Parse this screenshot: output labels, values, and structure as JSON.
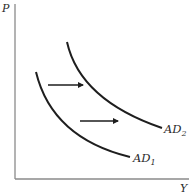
{
  "diagram": {
    "type": "aggregate-demand-shift",
    "axes": {
      "y_label": "P",
      "x_label": "Y"
    },
    "curves": [
      {
        "id": "AD1",
        "label_main": "AD",
        "label_sub": "1"
      },
      {
        "id": "AD2",
        "label_main": "AD",
        "label_sub": "2"
      }
    ],
    "arrows": [
      {
        "direction": "right",
        "meaning": "shift AD1 to AD2"
      },
      {
        "direction": "right",
        "meaning": "shift AD1 to AD2"
      }
    ],
    "colors": {
      "axis": "#8a8a8a",
      "curve": "#1e1e1e",
      "text": "#2a2a2a"
    }
  }
}
